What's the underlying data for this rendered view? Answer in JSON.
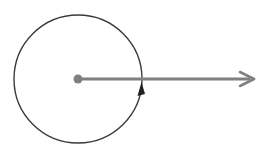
{
  "diagram": {
    "type": "rotation-angle",
    "canvas": {
      "width": 275,
      "height": 150,
      "background": "#ffffff"
    },
    "circle": {
      "cx": 78,
      "cy": 79,
      "r": 64,
      "stroke": "#3a3a3a",
      "stroke_width": 1.4
    },
    "center_point": {
      "cx": 78,
      "cy": 79,
      "r": 4.5,
      "fill": "#808080"
    },
    "ray": {
      "x1": 78,
      "y1": 79,
      "x2": 248,
      "y2": 79,
      "stroke": "#808080",
      "stroke_width": 3,
      "arrowhead": "open-chevron"
    },
    "rotation_arrowhead": {
      "x": 142,
      "y": 84,
      "direction": "up",
      "fill": "#222222"
    }
  }
}
